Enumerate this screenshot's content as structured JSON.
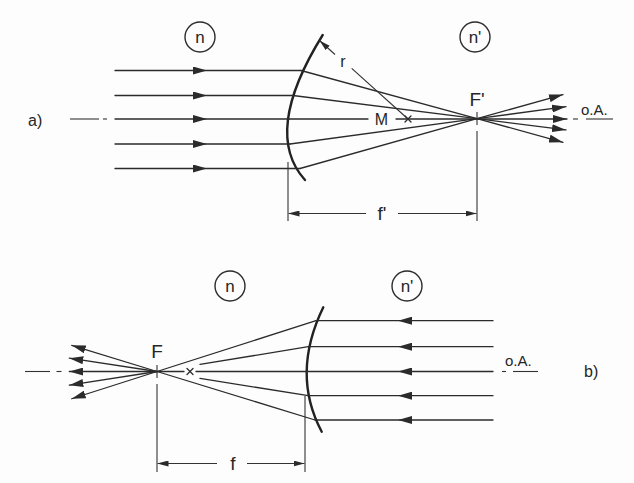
{
  "figure": {
    "line_color": "#2b2b2b",
    "panel_a": {
      "label": "a)",
      "medium_left": "n",
      "medium_right": "n'",
      "radius_label": "r",
      "center_label": "M",
      "focus_label": "F'",
      "focal_length_label": "f'",
      "axis_label": "o.A.",
      "ray_count": 5,
      "ray_direction": "left-to-right"
    },
    "panel_b": {
      "label": "b)",
      "medium_left": "n",
      "medium_right": "n'",
      "focus_label": "F",
      "focal_length_label": "f",
      "axis_label": "o.A.",
      "ray_count": 5,
      "ray_direction": "right-to-left"
    }
  }
}
